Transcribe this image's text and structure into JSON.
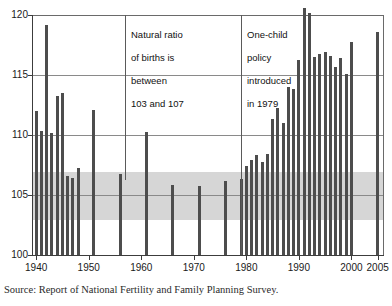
{
  "chart_data": {
    "type": "bar",
    "title": "",
    "subtitle": "",
    "xlabel": "",
    "ylabel": "",
    "xlim": [
      1939.2,
      2006.2
    ],
    "ylim": [
      100,
      120
    ],
    "y_ticks": [
      100,
      105,
      110,
      115,
      120
    ],
    "x_ticks": [
      1940,
      1950,
      1960,
      1970,
      1980,
      1990,
      2000,
      2005
    ],
    "grid": "horizontal",
    "legend": "none",
    "series_name": "Sex ratio at birth (males per 100 females)",
    "shaded_band": {
      "label": "Natural ratio of births",
      "from": 103,
      "to": 107,
      "color": "#d6d6d6"
    },
    "bar_color": "#4d4d4d",
    "x": [
      1940,
      1941,
      1942,
      1943,
      1944,
      1945,
      1946,
      1947,
      1948,
      1951,
      1956,
      1961,
      1966,
      1971,
      1976,
      1979,
      1980,
      1981,
      1982,
      1983,
      1984,
      1985,
      1986,
      1987,
      1988,
      1989,
      1990,
      1991,
      1992,
      1993,
      1994,
      1995,
      1996,
      1997,
      1998,
      1999,
      2000,
      2005
    ],
    "values": [
      112.0,
      110.4,
      119.2,
      110.2,
      113.3,
      113.5,
      106.6,
      106.5,
      107.3,
      112.1,
      106.8,
      110.3,
      105.9,
      105.8,
      106.2,
      106.4,
      107.5,
      108.0,
      108.4,
      107.8,
      108.5,
      111.4,
      112.3,
      111.0,
      114.0,
      113.9,
      116.3,
      120.6,
      120.2,
      116.5,
      116.8,
      116.9,
      116.6,
      115.7,
      116.4,
      115.1,
      117.8,
      118.6
    ],
    "annotations": [
      {
        "id": "natural-ratio-note",
        "text": "Natural ratio\nof births is\nbetween\n103 and 107",
        "pointer_year": 1957,
        "pointer_value": 105.0
      },
      {
        "id": "one-child-policy-note",
        "text": "One-child\npolicy\nintroduced\nin 1979",
        "pointer_year": 1979,
        "pointer_value": 100.0
      }
    ]
  },
  "axis": {
    "y_labels": [
      "120",
      "115",
      "110",
      "105",
      "100"
    ],
    "x_labels": [
      "1940",
      "1950",
      "1960",
      "1970",
      "1980",
      "1990",
      "2000",
      "2005"
    ]
  },
  "annotations": {
    "natural_ratio": {
      "line1": "Natural ratio",
      "line2": "of births is",
      "line3": "between",
      "line4": "103 and 107"
    },
    "one_child": {
      "line1": "One-child",
      "line2": "policy",
      "line3": "introduced",
      "line4": "in 1979"
    }
  },
  "source": {
    "text": "Source: Report of National Fertility and Family Planning Survey."
  }
}
